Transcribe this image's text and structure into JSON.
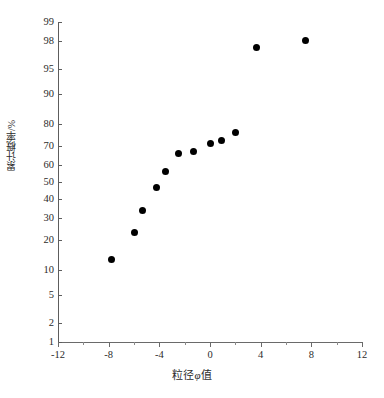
{
  "chart_data": {
    "type": "scatter",
    "title": "",
    "xlabel": "粒径φ值",
    "ylabel": "累计概率/%",
    "xlim": [
      -12,
      12
    ],
    "ylim": [
      1,
      99
    ],
    "y_scale": "probability",
    "grid": false,
    "legend": null,
    "marker": {
      "shape": "circle",
      "color": "#000000",
      "size": 7
    },
    "xticks": [
      -12,
      -8,
      -4,
      0,
      4,
      8,
      12
    ],
    "xtick_labels": [
      "-12",
      "-8",
      "-4",
      "0",
      "4",
      "8",
      "12"
    ],
    "x_minor_ticks": [
      -10,
      -6,
      -2,
      2,
      6,
      10
    ],
    "yticks": [
      1,
      2,
      5,
      10,
      20,
      30,
      40,
      50,
      60,
      70,
      80,
      90,
      95,
      98,
      99
    ],
    "ytick_labels": [
      "1",
      "2",
      "5",
      "10",
      "20",
      "30",
      "40",
      "50",
      "60",
      "70",
      "80",
      "90",
      "95",
      "98",
      "99"
    ],
    "series": [
      {
        "name": "累计概率",
        "x": [
          -7.8,
          -6.0,
          -5.3,
          -4.2,
          -3.5,
          -2.5,
          -1.3,
          0.0,
          0.9,
          2.0,
          3.7,
          7.5
        ],
        "y": [
          13.0,
          23.0,
          34.0,
          47.0,
          56.0,
          66.0,
          67.0,
          71.0,
          72.5,
          76.5,
          97.5,
          98.0
        ]
      }
    ]
  },
  "axes": {
    "x_title": "粒径",
    "x_symbol": "φ",
    "x_unit": "值",
    "y_title": "累计概率/%"
  },
  "caption": {
    "text": ""
  }
}
